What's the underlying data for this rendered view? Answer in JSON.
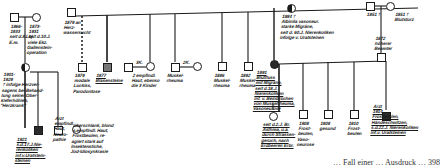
{
  "diagram": {
    "type": "pedigree",
    "caption": "… Fall einer … Ausdruck … 398",
    "generation_I": {
      "left_couple": {
        "father": {
          "label": "1866-\n1933\nseit d.8.Lbj.\nE.m.",
          "shape": "square"
        },
        "mother": {
          "label": "1873-\n1931\nseit d.10.J.\nviele Ekz.\nGallenstein-\noperation",
          "shape": "circle"
        }
      },
      "right_couple": {
        "father": {
          "label": "1851 †",
          "shape": "square"
        },
        "mother": {
          "label": "1851 †\nBlutsturz",
          "shape": "circle"
        }
      }
    },
    "generation_II": {
      "left_siblings": [
        {
          "label": "1901-\n1929\n† infolge Herzver-\nsagens bei Behand-\nlung seiner Ober-\nkieferhöhlen,\n\"Herzkrank\"",
          "shape": "circle",
          "fill": "half"
        },
        {
          "label": "1879 an\nHerz-\nwassersucht",
          "shape": "square",
          "fill": "none"
        }
      ],
      "top_sibship": [
        {
          "label": "1879\nmodale\nLuckiss,\nParodontose",
          "shape": "square",
          "fill": "none"
        },
        {
          "label": "1877\nBlasensteine",
          "shape": "square",
          "fill": "grey"
        },
        {
          "label": "2 empfindl.\nHaut, ebenso\ndie 3 Kinder",
          "shape": "circle",
          "fill": "none",
          "spouse_label": "3K."
        },
        {
          "label": "Muskel-\nrheuma",
          "shape": "square",
          "fill": "none",
          "spouse_label": "2K."
        },
        {
          "label": "1886\nMuskel-\nrheuma",
          "shape": "square",
          "fill": "none"
        },
        {
          "label": "1892\nMuskel-\nrheuma",
          "shape": "square",
          "fill": "none"
        },
        {
          "label": "1891\nBlutfluss\nmit Migräne,\nseit d.18.J.\nNierenkoliken\ninf. v. Beinbrüchen\nvon Muskelrheuma,\nVasoneurose",
          "shape": "circle",
          "fill": "dark"
        }
      ],
      "index_mother": {
        "label": "1884 †\nAlbinila vasoneur.\nstarke Migräne,\nseit d. 60.J. Nierenkoliken\ninfolge v. Uratsteinen",
        "shape": "circle",
        "fill": "half"
      },
      "index_father": {
        "label": "1872\nhöherer\nBeamter",
        "shape": "square",
        "fill": "none"
      }
    },
    "generation_III": {
      "left_children": [
        {
          "label": "1921\ns.d.17.J.Nie-\nrenkoliken\ninf.v.Uratstein-\nsteinen",
          "shape": "square",
          "fill": "dark"
        },
        {
          "label": "Arzt\nempfindl.\nHaut,\nNeuro-\npathie",
          "shape": "square",
          "fill": "none"
        },
        {
          "label": "überschlank, blond\ns.empfindl. Haut,\nFrostbeulen, re-\nagiert stark auf\nInsektenstiche,\nJod-Idiosynkrasie",
          "shape": "circle",
          "fill": "none"
        }
      ],
      "right_children": [
        {
          "label": "seit d.2.J. Br.\nAsthma, u.a.\ndurch Strassen-\ngeruch, nach\nErdbeeren Erbr.",
          "shape": "circle",
          "fill": "none"
        },
        {
          "label": "1908\nFrost-\nbeulen,\nVaso-\nneurose",
          "shape": "square",
          "fill": "none"
        },
        {
          "label": "1908\ngesund",
          "shape": "square",
          "fill": "none"
        },
        {
          "label": "1910\nFrost-\nbeulen",
          "shape": "square",
          "fill": "none"
        },
        {
          "label": "Arzt\n1914\nFrostbeulen,\nHändeschwitzen,\ns.d.22.J. Nierenkoliken\ninf.v. Uratsteinen",
          "shape": "square",
          "fill": "dark"
        }
      ]
    }
  }
}
